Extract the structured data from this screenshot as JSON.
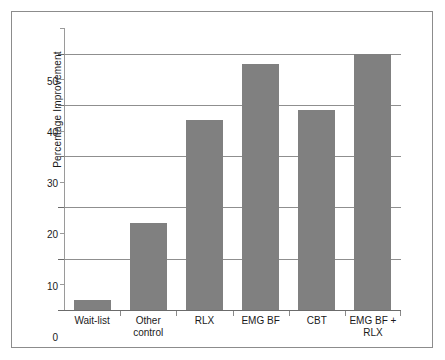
{
  "figure": {
    "frame_visible": true,
    "background": "#ffffff",
    "bar_color": "#808080",
    "axis_color": "#6b6b6b",
    "grid_color": "#8f8f8f"
  },
  "chart_data": {
    "type": "bar",
    "title": "",
    "subtitle": "",
    "xlabel": "",
    "ylabel": "Percentage Improvement",
    "categories": [
      "Wait-list",
      "Other\ncontrol",
      "RLX",
      "EMG BF",
      "CBT",
      "EMG BF +\nRLX"
    ],
    "values": [
      2,
      17,
      37,
      48,
      39,
      50
    ],
    "ylim": [
      0,
      55
    ],
    "ytick_values": [
      0,
      10,
      20,
      30,
      40,
      50
    ],
    "ytick_labels": [
      "0",
      "10",
      "20",
      "30",
      "40",
      "50"
    ],
    "yminor_tick_values": [
      5,
      15,
      25,
      35,
      45,
      55
    ],
    "grid": "horizontal-major",
    "legend": "none",
    "annotations": []
  }
}
